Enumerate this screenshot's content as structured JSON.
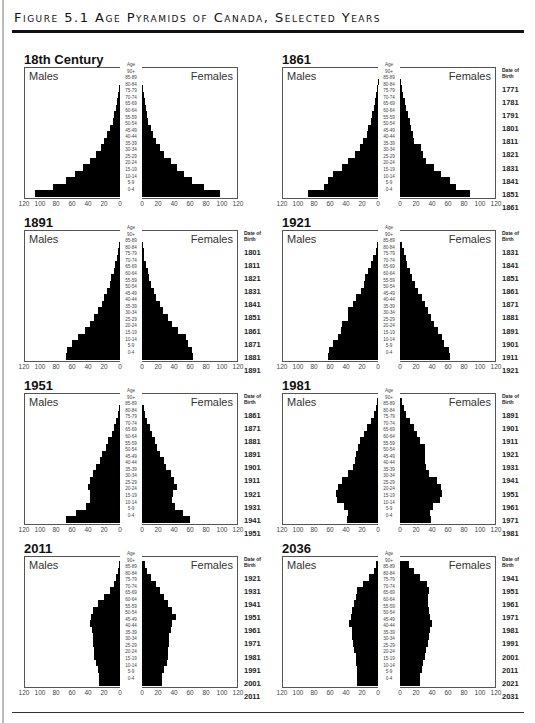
{
  "figure": {
    "title": "Figure 5.1 Age Pyramids of Canada, Selected Years"
  },
  "labels": {
    "males": "Males",
    "females": "Females",
    "age": "Age",
    "date_of_birth": "Date of Birth"
  },
  "age_groups": [
    "90+",
    "85-89",
    "80-84",
    "75-79",
    "70-74",
    "65-69",
    "60-64",
    "55-59",
    "50-54",
    "45-49",
    "40-44",
    "35-39",
    "30-34",
    "25-29",
    "20-24",
    "15-19",
    "10-14",
    "5-9",
    "0-4"
  ],
  "axis_ticks_males": [
    "120",
    "100",
    "80",
    "60",
    "40",
    "20",
    "0"
  ],
  "axis_ticks_females": [
    "0",
    "20",
    "40",
    "60",
    "80",
    "100",
    "120"
  ],
  "chart_data": [
    {
      "type": "bar",
      "title": "18th Century",
      "categories": [
        "0-4",
        "5-9",
        "10-14",
        "15-19",
        "20-24",
        "25-29",
        "30-34",
        "35-39",
        "40-44",
        "45-49",
        "50-54",
        "55-59",
        "60-64",
        "65-69",
        "70-74",
        "75-79",
        "80-84",
        "85-89",
        "90+"
      ],
      "series": [
        {
          "name": "Males",
          "values": [
            106,
            84,
            68,
            56,
            46,
            38,
            30,
            24,
            20,
            16,
            12,
            9,
            7,
            5,
            3.5,
            2,
            1,
            0,
            0
          ]
        },
        {
          "name": "Females",
          "values": [
            97,
            77,
            63,
            53,
            44,
            36,
            28,
            22,
            18,
            14,
            11,
            8,
            6,
            5,
            3.5,
            2,
            1,
            0,
            0
          ]
        }
      ],
      "date_of_birth": [],
      "xlabel": "",
      "ylabel": "Age",
      "xlim": [
        0,
        120
      ]
    },
    {
      "type": "bar",
      "title": "1861",
      "categories": [
        "0-4",
        "5-9",
        "10-14",
        "15-19",
        "20-24",
        "25-29",
        "30-34",
        "35-39",
        "40-44",
        "45-49",
        "50-54",
        "55-59",
        "60-64",
        "65-69",
        "70-74",
        "75-79",
        "80-84",
        "85-89",
        "90+"
      ],
      "series": [
        {
          "name": "Males",
          "values": [
            88,
            67,
            62,
            56,
            45,
            38,
            29,
            22,
            19,
            14,
            12,
            9,
            7,
            5,
            4,
            2,
            1,
            0.5,
            0
          ]
        },
        {
          "name": "Females",
          "values": [
            87,
            70,
            62,
            51,
            43,
            33,
            29,
            26,
            18,
            16,
            14,
            12,
            10,
            8,
            6,
            4,
            2,
            1,
            0
          ]
        }
      ],
      "date_of_birth": [
        "1861",
        "1851",
        "1841",
        "1831",
        "1821",
        "1811",
        "1801",
        "1791",
        "1781",
        "1771"
      ],
      "xlabel": "",
      "ylabel": "Age",
      "xlim": [
        0,
        120
      ]
    },
    {
      "type": "bar",
      "title": "1891",
      "categories": [
        "0-4",
        "5-9",
        "10-14",
        "15-19",
        "20-24",
        "25-29",
        "30-34",
        "35-39",
        "40-44",
        "45-49",
        "50-54",
        "55-59",
        "60-64",
        "65-69",
        "70-74",
        "75-79",
        "80-84",
        "85-89",
        "90+"
      ],
      "series": [
        {
          "name": "Males",
          "values": [
            68,
            66,
            60,
            52,
            44,
            38,
            33,
            28,
            23,
            20,
            16,
            12,
            11,
            8,
            6,
            4,
            3,
            1.5,
            0
          ]
        },
        {
          "name": "Females",
          "values": [
            64,
            62,
            58,
            55,
            45,
            38,
            32,
            26,
            22,
            18,
            15,
            11,
            9,
            7,
            5,
            3,
            2,
            1,
            0
          ]
        }
      ],
      "date_of_birth": [
        "1891",
        "1881",
        "1871",
        "1861",
        "1851",
        "1841",
        "1831",
        "1821",
        "1811",
        "1801"
      ],
      "xlabel": "",
      "ylabel": "Age",
      "xlim": [
        0,
        120
      ]
    },
    {
      "type": "bar",
      "title": "1921",
      "categories": [
        "0-4",
        "5-9",
        "10-14",
        "15-19",
        "20-24",
        "25-29",
        "30-34",
        "35-39",
        "40-44",
        "45-49",
        "50-54",
        "55-59",
        "60-64",
        "65-69",
        "70-74",
        "75-79",
        "80-84",
        "85-89",
        "90+"
      ],
      "series": [
        {
          "name": "Males",
          "values": [
            63,
            61,
            56,
            50,
            46,
            45,
            38,
            38,
            31,
            27,
            21,
            18,
            16,
            12,
            9,
            6,
            3,
            1,
            0
          ]
        },
        {
          "name": "Females",
          "values": [
            62,
            61,
            55,
            52,
            48,
            42,
            39,
            35,
            31,
            27,
            23,
            19,
            15,
            12,
            9,
            7,
            5,
            3,
            0
          ]
        }
      ],
      "date_of_birth": [
        "1921",
        "1911",
        "1901",
        "1891",
        "1881",
        "1871",
        "1861",
        "1851",
        "1841",
        "1831"
      ],
      "xlabel": "",
      "ylabel": "Age",
      "xlim": [
        0,
        120
      ]
    },
    {
      "type": "bar",
      "title": "1951",
      "categories": [
        "0-4",
        "5-9",
        "10-14",
        "15-19",
        "20-24",
        "25-29",
        "30-34",
        "35-39",
        "40-44",
        "45-49",
        "50-54",
        "55-59",
        "60-64",
        "65-69",
        "70-74",
        "75-79",
        "80-84",
        "85-89",
        "90+"
      ],
      "series": [
        {
          "name": "Males",
          "values": [
            67,
            55,
            42,
            38,
            38,
            40,
            38,
            34,
            30,
            25,
            22,
            18,
            15,
            10,
            7,
            5,
            3,
            1.5,
            0
          ]
        },
        {
          "name": "Females",
          "values": [
            60,
            51,
            41,
            37,
            39,
            44,
            40,
            36,
            30,
            27,
            22,
            19,
            16,
            13,
            10,
            6,
            4,
            2,
            0
          ]
        }
      ],
      "date_of_birth": [
        "1951",
        "1941",
        "1931",
        "1921",
        "1911",
        "1901",
        "1891",
        "1881",
        "1871",
        "1861"
      ],
      "xlabel": "",
      "ylabel": "Age",
      "xlim": [
        0,
        120
      ]
    },
    {
      "type": "bar",
      "title": "1981",
      "categories": [
        "0-4",
        "5-9",
        "10-14",
        "15-19",
        "20-24",
        "25-29",
        "30-34",
        "35-39",
        "40-44",
        "45-49",
        "50-54",
        "55-59",
        "60-64",
        "65-69",
        "70-74",
        "75-79",
        "80-84",
        "85-89",
        "90+"
      ],
      "series": [
        {
          "name": "Males",
          "values": [
            39,
            38,
            42,
            51,
            52,
            50,
            45,
            37,
            31,
            29,
            27,
            25,
            22,
            18,
            14,
            9,
            5,
            2,
            1
          ]
        },
        {
          "name": "Females",
          "values": [
            39,
            37,
            41,
            50,
            52,
            51,
            46,
            36,
            32,
            31,
            31,
            31,
            25,
            21,
            17,
            12,
            8,
            5,
            3
          ]
        }
      ],
      "date_of_birth": [
        "1981",
        "1971",
        "1961",
        "1951",
        "1941",
        "1931",
        "1921",
        "1911",
        "1901",
        "1891"
      ],
      "xlabel": "",
      "ylabel": "Age",
      "xlim": [
        0,
        120
      ]
    },
    {
      "type": "bar",
      "title": "2011",
      "categories": [
        "0-4",
        "5-9",
        "10-14",
        "15-19",
        "20-24",
        "25-29",
        "30-34",
        "35-39",
        "40-44",
        "45-49",
        "50-54",
        "55-59",
        "60-64",
        "65-69",
        "70-74",
        "75-79",
        "80-84",
        "85-89",
        "90+"
      ],
      "series": [
        {
          "name": "Males",
          "values": [
            26,
            26,
            28,
            30,
            32,
            33,
            34,
            34,
            35,
            38,
            36,
            34,
            27,
            20,
            12,
            8,
            5,
            3,
            1
          ]
        },
        {
          "name": "Females",
          "values": [
            25,
            25,
            27,
            31,
            32,
            33,
            34,
            34,
            36,
            38,
            42,
            37,
            33,
            28,
            22,
            17,
            11,
            6,
            4
          ]
        }
      ],
      "date_of_birth": [
        "2011",
        "2001",
        "1991",
        "1981",
        "1971",
        "1961",
        "1951",
        "1941",
        "1931",
        "1921"
      ],
      "xlabel": "",
      "ylabel": "Age",
      "xlim": [
        0,
        120
      ]
    },
    {
      "type": "bar",
      "title": "2036",
      "categories": [
        "0-4",
        "5-9",
        "10-14",
        "15-19",
        "20-24",
        "25-29",
        "30-34",
        "35-39",
        "40-44",
        "45-49",
        "50-54",
        "55-59",
        "60-64",
        "65-69",
        "70-74",
        "75-79",
        "80-84",
        "85-89",
        "90+"
      ],
      "series": [
        {
          "name": "Males",
          "values": [
            26,
            26,
            26,
            27,
            28,
            30,
            31,
            32,
            33,
            36,
            34,
            32,
            30,
            28,
            26,
            19,
            11,
            5,
            2
          ]
        },
        {
          "name": "Females",
          "values": [
            25,
            25,
            27,
            29,
            31,
            33,
            35,
            36,
            38,
            40,
            38,
            36,
            35,
            35,
            36,
            34,
            25,
            18,
            11
          ]
        }
      ],
      "date_of_birth": [
        "2031",
        "2021",
        "2011",
        "2001",
        "1991",
        "1981",
        "1971",
        "1961",
        "1951",
        "1941"
      ],
      "xlabel": "",
      "ylabel": "Age",
      "xlim": [
        0,
        120
      ]
    }
  ]
}
